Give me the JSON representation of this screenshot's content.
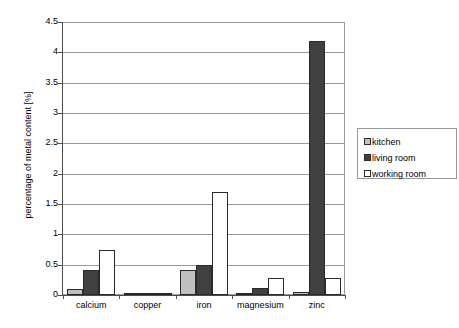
{
  "chart_data": {
    "type": "bar",
    "title": "",
    "xlabel": "",
    "ylabel": "percentage of metal content [%]",
    "categories": [
      "calcium",
      "copper",
      "iron",
      "magnesium",
      "zinc"
    ],
    "series": [
      {
        "name": "kitchen",
        "color": "#c0c0c0",
        "values": [
          0.1,
          0.02,
          0.42,
          0.04,
          0.05
        ]
      },
      {
        "name": "living room",
        "color": "#404040",
        "values": [
          0.42,
          0.02,
          0.5,
          0.12,
          4.18
        ]
      },
      {
        "name": "working room",
        "color": "#ffffff",
        "values": [
          0.75,
          0.02,
          1.7,
          0.28,
          0.28
        ]
      }
    ],
    "ylim": [
      0,
      4.5
    ],
    "yticks": [
      "0",
      "0.5",
      "1",
      "1.5",
      "2",
      "2.5",
      "3",
      "3.5",
      "4",
      "4.5"
    ],
    "ytick_values": [
      0,
      0.5,
      1,
      1.5,
      2,
      2.5,
      3,
      3.5,
      4,
      4.5
    ],
    "grid": true,
    "legend_position": "right",
    "legend_entries": [
      "kitchen",
      "living room",
      "working room"
    ]
  }
}
